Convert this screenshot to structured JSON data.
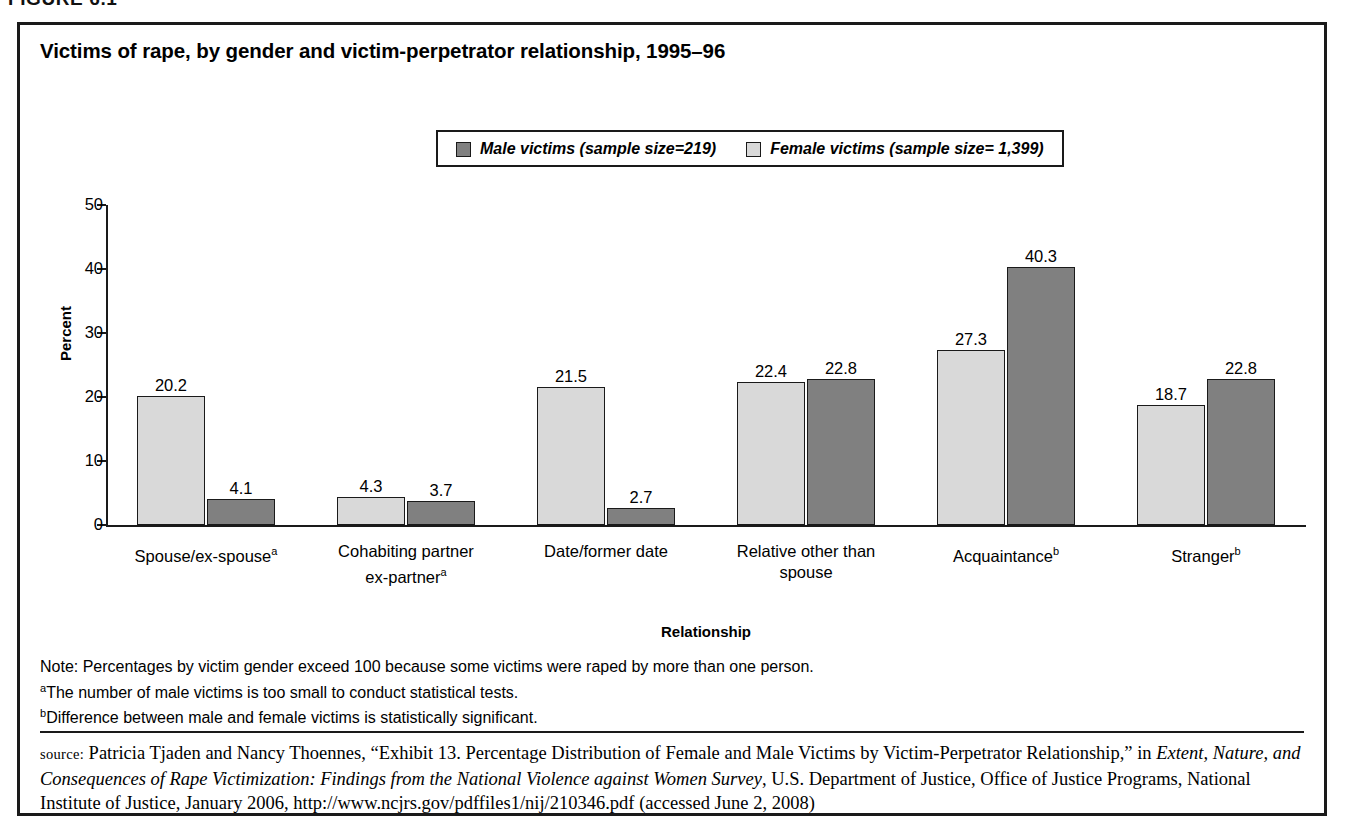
{
  "figure_tag": "FIGURE 6.1",
  "title": "Victims of rape, by gender and victim-perpetrator relationship, 1995–96",
  "legend": {
    "items": [
      {
        "label": "Male victims (sample size=219)",
        "color": "#808080",
        "key": "male"
      },
      {
        "label": "Female victims (sample size= 1,399)",
        "color": "#d9d9d9",
        "key": "female"
      }
    ]
  },
  "axes": {
    "ylabel": "Percent",
    "xlabel": "Relationship",
    "yticks": [
      "0",
      "10",
      "20",
      "30",
      "40",
      "50"
    ]
  },
  "notes": {
    "note": "Note: Percentages by victim gender exceed 100 because some victims were raped by more than one person.",
    "footnote_a_marker": "a",
    "footnote_a": "The number of male victims is too small to conduct statistical tests.",
    "footnote_b_marker": "b",
    "footnote_b": "Difference between male and female victims is statistically significant."
  },
  "source": {
    "label": "source:",
    "part1": " Patricia Tjaden and Nancy Thoennes, “Exhibit 13. Percentage Distribution of Female and Male Victims by Victim-Perpetrator Relationship,” in ",
    "italic": "Extent, Nature, and Consequences of Rape Victimization: Findings from the National Violence against Women Survey",
    "part2": ", U.S. Department of Justice, Office of Justice Programs, National Institute of Justice, January 2006, http://www.ncjrs.gov/pdffiles1/nij/210346.pdf (accessed June 2, 2008)"
  },
  "chart_data": {
    "type": "bar",
    "title": "Victims of rape, by gender and victim-perpetrator relationship, 1995–96",
    "xlabel": "Relationship",
    "ylabel": "Percent",
    "ylim": [
      0,
      50
    ],
    "yticks": [
      0,
      10,
      20,
      30,
      40,
      50
    ],
    "grid": false,
    "legend_position": "top-center",
    "categories": [
      "Spouse/ex-spouseᵃ",
      "Cohabiting partner ex-partnerᵃ",
      "Date/former date",
      "Relative other than spouse",
      "Acquaintanceᵇ",
      "Strangerᵇ"
    ],
    "category_lines": [
      [
        "Spouse/ex-spouse",
        "a",
        ""
      ],
      [
        "Cohabiting partner",
        "a",
        "ex-partner"
      ],
      [
        "Date/former date",
        "",
        ""
      ],
      [
        "Relative other than",
        "",
        "spouse"
      ],
      [
        "Acquaintance",
        "b",
        ""
      ],
      [
        "Stranger",
        "b",
        ""
      ]
    ],
    "series": [
      {
        "name": "Female victims (sample size= 1,399)",
        "key": "female",
        "color": "#d9d9d9",
        "values": [
          20.2,
          4.3,
          21.5,
          22.4,
          27.3,
          18.7
        ]
      },
      {
        "name": "Male victims (sample size=219)",
        "key": "male",
        "color": "#808080",
        "values": [
          4.1,
          3.7,
          2.7,
          22.8,
          40.3,
          22.8
        ]
      }
    ]
  }
}
